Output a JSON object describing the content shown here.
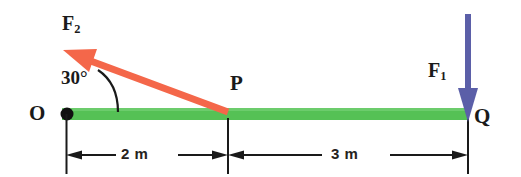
{
  "figure": {
    "type": "free-body-diagram",
    "background_color": "#ffffff"
  },
  "beam": {
    "name": "beam",
    "color": "#55c155",
    "start_label": "O",
    "mid_label": "P",
    "end_label": "Q",
    "x_start": 62,
    "x_mid": 228,
    "x_end": 468,
    "y_top": 108,
    "y_bottom": 120
  },
  "pivot": {
    "label": "O",
    "color": "#111111",
    "cx": 66,
    "cy": 114,
    "r": 6
  },
  "points": {
    "O": {
      "label": "O"
    },
    "P": {
      "label": "P"
    },
    "Q": {
      "label": "Q"
    }
  },
  "forces": [
    {
      "id": "F1",
      "label": "F",
      "subscript": "1",
      "color": "#5b5fa8",
      "applied_at": "Q",
      "direction": "down",
      "angle_deg": 270,
      "tail_x": 468,
      "tail_y": 14,
      "head_x": 468,
      "head_y": 118
    },
    {
      "id": "F2",
      "label": "F",
      "subscript": "2",
      "color": "#f4674a",
      "applied_at": "P",
      "direction": "up-left",
      "angle_from_beam_deg": 30,
      "tail_x": 228,
      "tail_y": 112,
      "head_x": 66,
      "head_y": 51
    }
  ],
  "angle": {
    "name": "angle-between-F2-and-beam",
    "value": "30",
    "unit": "°",
    "text": "30°",
    "vertex": "P",
    "arc_color": "#1a1a1a"
  },
  "dimensions": [
    {
      "id": "dim-OP",
      "text": "2 m",
      "value": 2,
      "unit": "m",
      "from": "O",
      "to": "P",
      "x_from": 66,
      "x_to": 228,
      "y": 155
    },
    {
      "id": "dim-PQ",
      "text": "3 m",
      "value": 3,
      "unit": "m",
      "from": "P",
      "to": "Q",
      "x_from": 228,
      "x_to": 468,
      "y": 155
    }
  ],
  "colors": {
    "beam_green": "#55c155",
    "force_orange": "#f4674a",
    "force_blue": "#5b5fa8",
    "line_black": "#1a1a1a",
    "text_black": "#262220"
  }
}
